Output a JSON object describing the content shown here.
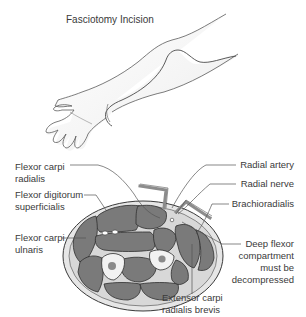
{
  "figure": {
    "title": "Fasciotomy Incision",
    "top_panel": {
      "subject": "arm-with-incision-line",
      "incision": "volar forearm curvilinear incision from elbow to wrist/palm"
    },
    "bottom_panel": {
      "subject": "forearm-cross-section",
      "labels_left": [
        {
          "line1": "Flexor carpi",
          "line2": "radialis"
        },
        {
          "line1": "Flexor digitorum",
          "line2": "superficialis"
        },
        {
          "line1": "Flexor carpi",
          "line2": "ulnaris"
        }
      ],
      "labels_right": [
        {
          "text": "Radial artery"
        },
        {
          "text": "Radial nerve"
        },
        {
          "text": "Brachioradialis"
        },
        {
          "line1": "Deep flexor",
          "line2": "compartment",
          "line3": "must be",
          "line4": "decompressed"
        }
      ],
      "label_bottom": {
        "line1": "Extensor carpi",
        "line2": "radialis brevis"
      }
    },
    "colors": {
      "muscle": "#7a7a7a",
      "muscle_outline": "#2e2e2e",
      "fascia": "#e6e6e6",
      "bone": "#f2f2f2",
      "retractor": "#8c8c8c",
      "text": "#3a3a3a",
      "leader": "#555555"
    }
  }
}
